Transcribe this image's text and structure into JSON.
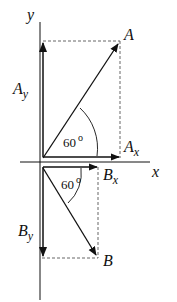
{
  "diagram": {
    "type": "vector-components",
    "axes": {
      "x_label": "x",
      "y_label": "y"
    },
    "vectors": [
      {
        "name": "A",
        "label": "A",
        "angle_label": "60",
        "angle_unit": "o",
        "components": {
          "x_label": "A",
          "x_sub": "x",
          "y_label": "A",
          "y_sub": "y"
        }
      },
      {
        "name": "B",
        "label": "B",
        "angle_label": "60",
        "angle_unit": "o",
        "components": {
          "x_label": "B",
          "x_sub": "x",
          "y_label": "B",
          "y_sub": "y"
        }
      }
    ],
    "colors": {
      "stroke": "#111111",
      "dashed": "#555555",
      "background": "#ffffff"
    }
  }
}
